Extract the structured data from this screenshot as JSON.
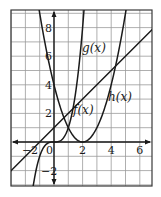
{
  "chart_data": {
    "type": "line",
    "title": "",
    "xlabel": "",
    "ylabel": "",
    "xlim": [
      -3,
      6.85
    ],
    "ylim": [
      -3.1,
      9.2
    ],
    "grid": true,
    "grid_step": 1,
    "x_ticks": [
      {
        "value": -2,
        "label": "−2"
      },
      {
        "value": 0,
        "label": "0"
      },
      {
        "value": 2,
        "label": "2"
      },
      {
        "value": 4,
        "label": "4"
      },
      {
        "value": 6,
        "label": "6"
      }
    ],
    "y_ticks": [
      {
        "value": 8,
        "label": "8"
      },
      {
        "value": 6,
        "label": "6"
      },
      {
        "value": 4,
        "label": "4"
      },
      {
        "value": 2,
        "label": "2"
      },
      {
        "value": -2,
        "label": "−2"
      }
    ],
    "series": [
      {
        "name": "f(x)",
        "expression": "x^3",
        "label_pos": [
          1.3,
          2.2
        ]
      },
      {
        "name": "g(x)",
        "expression": "(x-2)^2",
        "label_pos": [
          2.0,
          6.5
        ]
      },
      {
        "name": "h(x)",
        "expression": "x+1",
        "label_pos": [
          3.8,
          3.1
        ]
      }
    ],
    "curves": {
      "f": {
        "x": [
          -1.45,
          -1,
          -0.5,
          0,
          0.5,
          1,
          1.5,
          2.05
        ],
        "y": [
          -3.05,
          -1,
          -0.125,
          0,
          0.125,
          1,
          3.375,
          8.6
        ]
      },
      "g": {
        "x": [
          -1,
          0,
          1,
          2,
          3,
          4,
          5
        ],
        "y": [
          9,
          4,
          1,
          0,
          1,
          4,
          9
        ]
      },
      "h": {
        "x": [
          -3,
          6.85
        ],
        "y": [
          -2,
          7.85
        ]
      }
    },
    "colors": {
      "line": "#1a1a1a",
      "grid": "#9a9a9a",
      "frame": "#3a3a3a"
    }
  },
  "labels": {
    "f": "f(x)",
    "g": "g(x)",
    "h": "h(x)"
  }
}
